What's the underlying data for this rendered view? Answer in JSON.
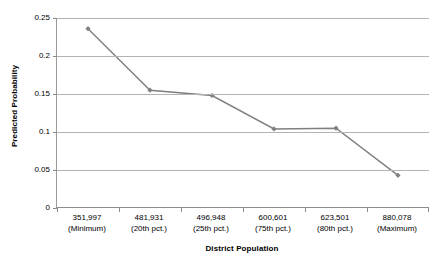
{
  "chart_data": {
    "type": "line",
    "title": "",
    "xlabel": "District Population",
    "ylabel": "Predicted Probability",
    "categories": [
      "351,997 (Minimum)",
      "481,931 (20th pct.)",
      "496,948 (25th pct.)",
      "600,601 (75th pct.)",
      "623,501 (80th pct.)",
      "880,078 (Maximum)"
    ],
    "category_values": [
      "351,997",
      "481,931",
      "496,948",
      "600,601",
      "623,501",
      "880,078"
    ],
    "category_subs": [
      "(Minimum)",
      "(20th pct.)",
      "(25th pct.)",
      "(75th pct.)",
      "(80th pct.)",
      "(Maximum)"
    ],
    "values": [
      0.236,
      0.155,
      0.148,
      0.104,
      0.105,
      0.043
    ],
    "ylim": [
      0,
      0.25
    ],
    "yticks": [
      0,
      0.05,
      0.1,
      0.15,
      0.2,
      0.25
    ],
    "ytick_labels": [
      "0",
      "0.05",
      "0.1",
      "0.15",
      "0.2",
      "0.25"
    ],
    "grid": true,
    "legend": "none",
    "series": [
      {
        "name": "Predicted Probability",
        "values": [
          0.236,
          0.155,
          0.148,
          0.104,
          0.105,
          0.043
        ],
        "line_color": "#7f7f7f",
        "marker_color": "#808080",
        "marker": "diamond"
      }
    ],
    "colors": {
      "line": "#7f7f7f",
      "marker": "#808080",
      "gridline": "#b3b3b3",
      "axis": "#8c8c8c",
      "background": "#ffffff",
      "text": "#000000"
    }
  }
}
